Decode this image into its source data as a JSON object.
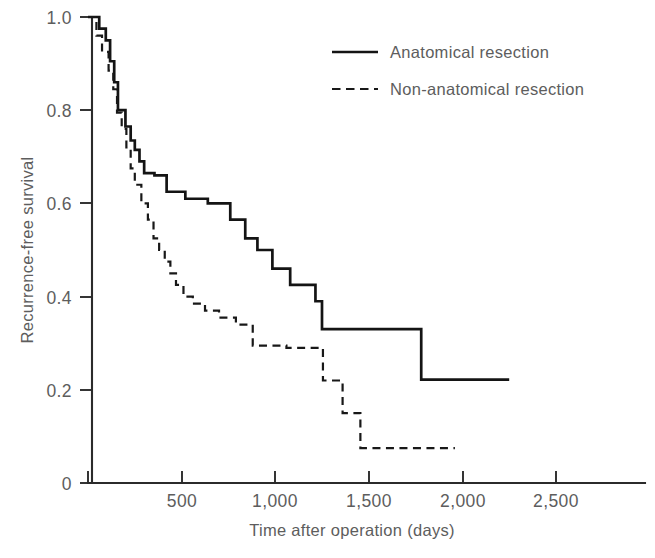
{
  "chart_data": {
    "type": "line",
    "subtype": "kaplan-meier-step",
    "title": "",
    "xlabel": "Time after operation (days)",
    "ylabel": "Recurrence-free survival",
    "xlim": [
      0,
      2700
    ],
    "ylim": [
      0,
      1.0
    ],
    "xticks": [
      0,
      500,
      1000,
      1500,
      2000,
      2500
    ],
    "xtick_labels": [
      "0",
      "500",
      "1,000",
      "1,500",
      "2,000",
      "2,500"
    ],
    "yticks": [
      0,
      0.2,
      0.4,
      0.6,
      0.8,
      1.0
    ],
    "ytick_labels": [
      "0",
      "0.2",
      "0.4",
      "0.6",
      "0.8",
      "1.0"
    ],
    "grid": false,
    "legend_position": "top-right",
    "series": [
      {
        "name": "Anatomical resection",
        "style": "solid",
        "color": "#141414",
        "points": [
          [
            0,
            1.0
          ],
          [
            60,
            1.0
          ],
          [
            60,
            0.975
          ],
          [
            95,
            0.975
          ],
          [
            95,
            0.95
          ],
          [
            118,
            0.95
          ],
          [
            118,
            0.905
          ],
          [
            140,
            0.905
          ],
          [
            140,
            0.86
          ],
          [
            160,
            0.86
          ],
          [
            160,
            0.8
          ],
          [
            200,
            0.8
          ],
          [
            200,
            0.765
          ],
          [
            228,
            0.765
          ],
          [
            228,
            0.735
          ],
          [
            250,
            0.735
          ],
          [
            250,
            0.715
          ],
          [
            275,
            0.715
          ],
          [
            275,
            0.69
          ],
          [
            300,
            0.69
          ],
          [
            300,
            0.665
          ],
          [
            355,
            0.665
          ],
          [
            355,
            0.66
          ],
          [
            420,
            0.66
          ],
          [
            420,
            0.625
          ],
          [
            520,
            0.625
          ],
          [
            520,
            0.61
          ],
          [
            640,
            0.61
          ],
          [
            640,
            0.6
          ],
          [
            760,
            0.6
          ],
          [
            760,
            0.565
          ],
          [
            840,
            0.565
          ],
          [
            840,
            0.525
          ],
          [
            905,
            0.525
          ],
          [
            905,
            0.5
          ],
          [
            985,
            0.5
          ],
          [
            985,
            0.46
          ],
          [
            1080,
            0.46
          ],
          [
            1080,
            0.425
          ],
          [
            1215,
            0.425
          ],
          [
            1215,
            0.39
          ],
          [
            1250,
            0.39
          ],
          [
            1250,
            0.33
          ],
          [
            1780,
            0.33
          ],
          [
            1780,
            0.222
          ],
          [
            2250,
            0.222
          ]
        ]
      },
      {
        "name": "Non-anatomical resection",
        "style": "dashed",
        "color": "#181818",
        "points": [
          [
            0,
            1.0
          ],
          [
            45,
            1.0
          ],
          [
            45,
            0.96
          ],
          [
            75,
            0.96
          ],
          [
            75,
            0.925
          ],
          [
            110,
            0.925
          ],
          [
            110,
            0.885
          ],
          [
            135,
            0.885
          ],
          [
            135,
            0.845
          ],
          [
            155,
            0.845
          ],
          [
            155,
            0.795
          ],
          [
            180,
            0.795
          ],
          [
            180,
            0.76
          ],
          [
            205,
            0.76
          ],
          [
            205,
            0.72
          ],
          [
            228,
            0.72
          ],
          [
            228,
            0.675
          ],
          [
            250,
            0.675
          ],
          [
            250,
            0.64
          ],
          [
            285,
            0.64
          ],
          [
            285,
            0.6
          ],
          [
            320,
            0.6
          ],
          [
            320,
            0.565
          ],
          [
            350,
            0.565
          ],
          [
            350,
            0.525
          ],
          [
            380,
            0.525
          ],
          [
            380,
            0.5
          ],
          [
            410,
            0.5
          ],
          [
            410,
            0.475
          ],
          [
            440,
            0.475
          ],
          [
            440,
            0.45
          ],
          [
            470,
            0.45
          ],
          [
            470,
            0.425
          ],
          [
            510,
            0.425
          ],
          [
            510,
            0.4
          ],
          [
            560,
            0.4
          ],
          [
            560,
            0.385
          ],
          [
            625,
            0.385
          ],
          [
            625,
            0.37
          ],
          [
            700,
            0.37
          ],
          [
            700,
            0.355
          ],
          [
            790,
            0.355
          ],
          [
            790,
            0.34
          ],
          [
            880,
            0.34
          ],
          [
            880,
            0.295
          ],
          [
            1060,
            0.295
          ],
          [
            1060,
            0.29
          ],
          [
            1255,
            0.29
          ],
          [
            1255,
            0.22
          ],
          [
            1360,
            0.22
          ],
          [
            1360,
            0.15
          ],
          [
            1455,
            0.15
          ],
          [
            1455,
            0.075
          ],
          [
            1960,
            0.075
          ]
        ]
      }
    ]
  },
  "legend": {
    "items": [
      {
        "label": "Anatomical resection",
        "style": "solid"
      },
      {
        "label": "Non-anatomical resection",
        "style": "dashed"
      }
    ]
  },
  "axes": {
    "y_title": "Recurrence-free survival",
    "x_title": "Time after operation (days)",
    "y_labels": [
      "1.0",
      "0.8",
      "0.6",
      "0.4",
      "0.2",
      "0"
    ],
    "x_labels": [
      "0",
      "500",
      "1,000",
      "1,500",
      "2,000",
      "2,500"
    ]
  },
  "colors": {
    "background": "#ffffff",
    "axis": "#2b2b2b",
    "text": "#5d5d5d",
    "series_solid": "#141414",
    "series_dashed": "#181818"
  }
}
